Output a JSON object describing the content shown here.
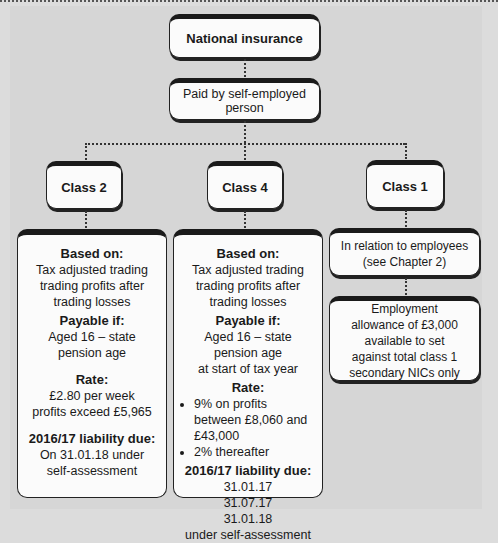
{
  "diagram": {
    "root": {
      "label": "National insurance"
    },
    "payer": {
      "label": "Paid by self-employed person"
    },
    "classes": [
      {
        "label": "Class 2",
        "details": {
          "based_on_heading": "Based on:",
          "based_on_lines": [
            "Tax adjusted trading",
            "trading profits after",
            "trading losses"
          ],
          "payable_heading": "Payable if:",
          "payable_lines": [
            "Aged 16 – state",
            "pension age"
          ],
          "rate_heading": "Rate:",
          "rate_lines": [
            "£2.80 per week",
            "profits exceed £5,965"
          ],
          "liability_heading": "2016/17  liability due:",
          "liability_lines": [
            "On 31.01.18 under",
            "self-assessment"
          ]
        }
      },
      {
        "label": "Class 4",
        "details": {
          "based_on_heading": "Based on:",
          "based_on_lines": [
            "Tax adjusted trading",
            "trading profits after",
            "trading losses"
          ],
          "payable_heading": "Payable if:",
          "payable_lines": [
            "Aged 16 – state",
            "pension age",
            "at start of tax year"
          ],
          "rate_heading": "Rate:",
          "rate_bullets": [
            "9% on profits between £8,060 and £43,000",
            "2% thereafter"
          ],
          "liability_heading": "2016/17  liability due:",
          "liability_lines": [
            "31.01.17",
            "31.07.17",
            "31.01.18",
            "under self-assessment"
          ]
        }
      },
      {
        "label": "Class 1",
        "relation": "In relation to employees (see Chapter 2)",
        "allowance": "Employment allowance of £3,000 available to set against total class 1 secondary NICs only"
      }
    ]
  }
}
